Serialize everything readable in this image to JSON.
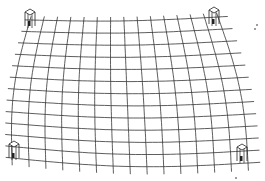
{
  "image": {
    "description": "Hand-drawn sketch of a warped grid mesh supported by four corner posts",
    "stroke_color": "#333333",
    "post_color": "#222222",
    "background": "#ffffff"
  },
  "grid": {
    "top_left": [
      30,
      20
    ],
    "top_right": [
      218,
      17
    ],
    "bottom_left": [
      12,
      158
    ],
    "bottom_right": [
      248,
      163
    ],
    "rows": 12,
    "cols": 14,
    "sag": 10
  },
  "posts": [
    {
      "name": "post-top-left",
      "x": 30,
      "y": 20
    },
    {
      "name": "post-top-right",
      "x": 214,
      "y": 18
    },
    {
      "name": "post-bottom-left",
      "x": 14,
      "y": 152
    },
    {
      "name": "post-bottom-right",
      "x": 242,
      "y": 155
    }
  ],
  "specks": [
    [
      257,
      25
    ],
    [
      255,
      29
    ],
    [
      236,
      178
    ]
  ]
}
